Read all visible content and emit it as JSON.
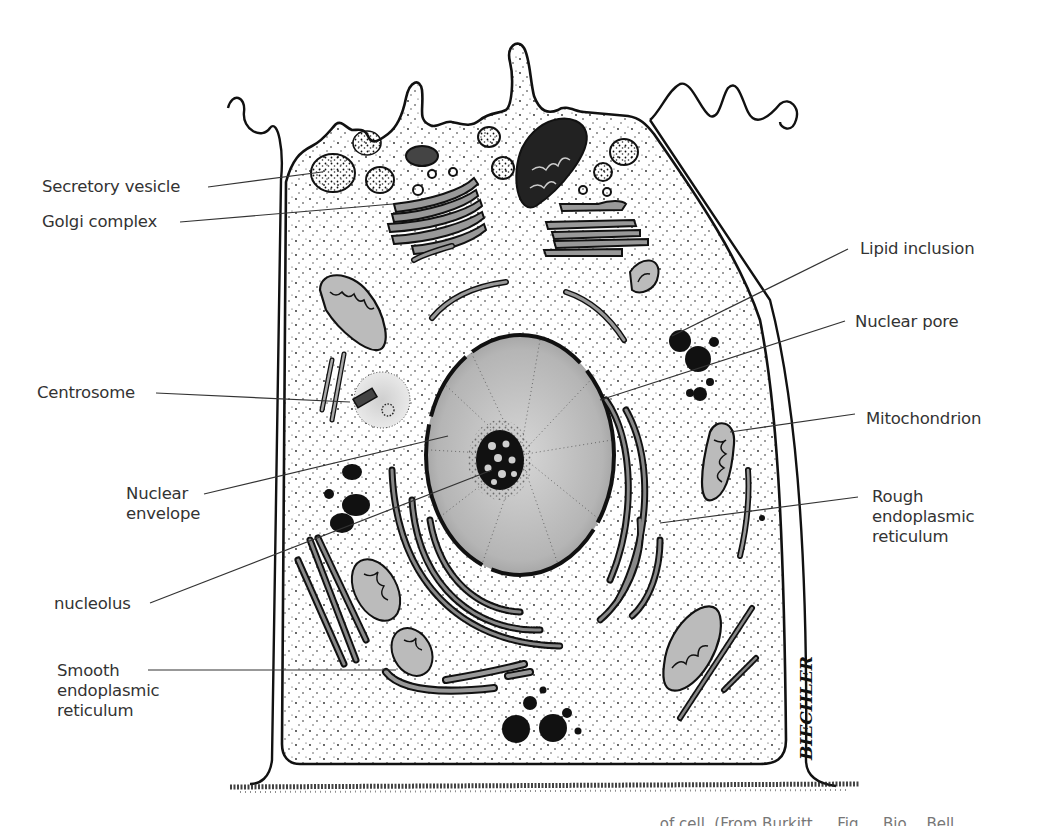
{
  "figure": {
    "artist_signature": "BIECHLER",
    "caption_partial": "… of cell. (From Burkitt … Fig … Bio…  Bell …",
    "colors": {
      "ink": "#111111",
      "label_text": "#333333",
      "leader_line": "#333333",
      "nucleoplasm": "#bdbdbd",
      "organelle_fill": "#9a9a9a",
      "background": "#ffffff"
    }
  },
  "labels": {
    "left": [
      {
        "id": "secretory-vesicle",
        "text": "Secretory vesicle"
      },
      {
        "id": "golgi-complex",
        "text": "Golgi complex"
      },
      {
        "id": "centrosome",
        "text": "Centrosome"
      },
      {
        "id": "nuclear-envelope",
        "text": "Nuclear envelope",
        "lines": [
          "Nuclear",
          "envelope"
        ]
      },
      {
        "id": "nucleolus",
        "text": "nucleolus"
      },
      {
        "id": "smooth-er",
        "text": "Smooth endoplasmic reticulum",
        "lines": [
          "Smooth",
          "endoplasmic",
          "reticulum"
        ]
      }
    ],
    "right": [
      {
        "id": "lipid-inclusion",
        "text": "Lipid inclusion"
      },
      {
        "id": "nuclear-pore",
        "text": "Nuclear pore"
      },
      {
        "id": "mitochondrion",
        "text": "Mitochondrion"
      },
      {
        "id": "rough-er",
        "text": "Rough endoplasmic reticulum",
        "lines": [
          "Rough",
          "endoplasmic",
          "reticulum"
        ]
      }
    ]
  }
}
